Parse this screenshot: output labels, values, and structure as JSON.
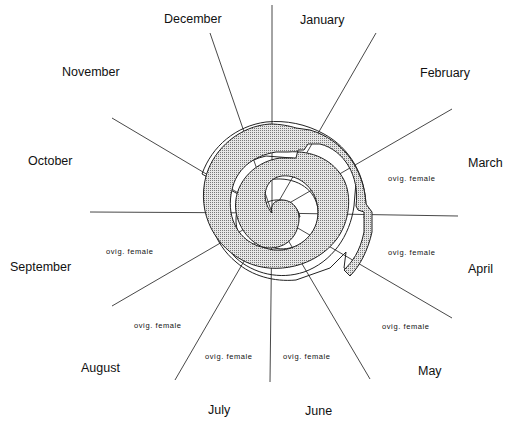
{
  "diagram": {
    "type": "spiral-calendar",
    "months": [
      {
        "label": "January",
        "x": 300,
        "y": 13
      },
      {
        "label": "February",
        "x": 420,
        "y": 66
      },
      {
        "label": "March",
        "x": 468,
        "y": 156
      },
      {
        "label": "April",
        "x": 468,
        "y": 262
      },
      {
        "label": "May",
        "x": 418,
        "y": 364
      },
      {
        "label": "June",
        "x": 305,
        "y": 404
      },
      {
        "label": "July",
        "x": 208,
        "y": 403
      },
      {
        "label": "August",
        "x": 81,
        "y": 361
      },
      {
        "label": "September",
        "x": 10,
        "y": 260
      },
      {
        "label": "October",
        "x": 28,
        "y": 154
      },
      {
        "label": "November",
        "x": 62,
        "y": 65
      },
      {
        "label": "December",
        "x": 164,
        "y": 12
      }
    ],
    "annotations": [
      {
        "label": "ovig. female",
        "x": 388,
        "y": 174
      },
      {
        "label": "ovig. female",
        "x": 388,
        "y": 248
      },
      {
        "label": "ovig. female",
        "x": 382,
        "y": 322
      },
      {
        "label": "ovig. female",
        "x": 283,
        "y": 352
      },
      {
        "label": "ovig. female",
        "x": 205,
        "y": 352
      },
      {
        "label": "ovig. female",
        "x": 134,
        "y": 321
      },
      {
        "label": "ovig. female",
        "x": 106,
        "y": 247
      }
    ]
  }
}
